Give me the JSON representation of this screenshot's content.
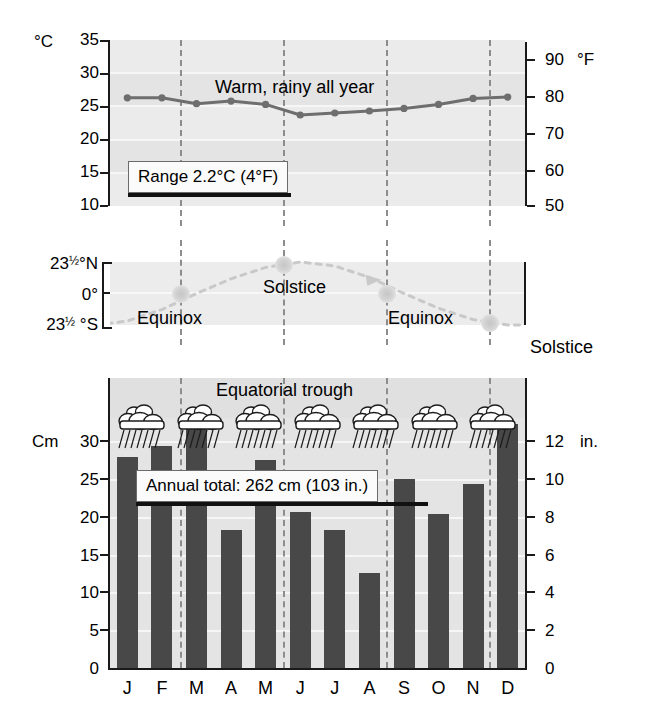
{
  "chart_data": [
    {
      "type": "line",
      "title": "Temperature",
      "categories": [
        "J",
        "F",
        "M",
        "A",
        "M",
        "J",
        "J",
        "A",
        "S",
        "O",
        "N",
        "D"
      ],
      "values": [
        26.3,
        26.3,
        25.4,
        25.8,
        25.3,
        23.7,
        24.0,
        24.3,
        24.7,
        25.3,
        26.2,
        26.4
      ],
      "ylabel": "°C",
      "ylabel_right": "°F",
      "yticks": [
        10,
        15,
        20,
        25,
        30,
        35
      ],
      "yticks_right": [
        50,
        60,
        70,
        80,
        90
      ],
      "ylim": [
        10,
        35
      ],
      "ylim_right": [
        50,
        90
      ],
      "grid": true,
      "annotation": "Warm, rainy all year",
      "callout": "Range 2.2°C (4°F)"
    },
    {
      "type": "line",
      "title": "Sun's declination",
      "categories": [
        "J",
        "F",
        "M",
        "A",
        "M",
        "J",
        "J",
        "A",
        "S",
        "O",
        "N",
        "D"
      ],
      "values": [
        -20.5,
        -12.0,
        0.0,
        11.0,
        19.5,
        23.5,
        20.5,
        12.0,
        0.0,
        -11.0,
        -19.5,
        -23.5
      ],
      "ytick_labels": [
        "23½°N",
        "0°",
        "23½ °S"
      ],
      "ylim": [
        -23.5,
        23.5
      ],
      "markers": [
        {
          "label": "Equinox",
          "month": "M"
        },
        {
          "label": "Solstice",
          "month": "J"
        },
        {
          "label": "Equinox",
          "month": "S"
        },
        {
          "label": "Solstice",
          "month": "D"
        }
      ]
    },
    {
      "type": "bar",
      "title": "Precipitation",
      "categories": [
        "J",
        "F",
        "M",
        "A",
        "M",
        "J",
        "J",
        "A",
        "S",
        "O",
        "N",
        "D"
      ],
      "values": [
        24.0,
        25.3,
        29.0,
        15.7,
        23.7,
        17.8,
        15.7,
        10.8,
        21.5,
        17.5,
        21.0,
        27.8
      ],
      "ylabel": "Cm",
      "ylabel_right": "in.",
      "yticks": [
        0,
        5,
        10,
        15,
        20,
        25,
        30
      ],
      "yticks_right": [
        0,
        2,
        4,
        6,
        8,
        10,
        12
      ],
      "ylim": [
        0,
        33
      ],
      "ylim_right": [
        0,
        13
      ],
      "grid": true,
      "annotation": "Equatorial trough",
      "callout": "Annual total: 262 cm (103 in.)",
      "weather_icons": 7,
      "weather_icon_name": "rain-cloud-icon"
    }
  ],
  "temp": {
    "unit_left": "°C",
    "unit_right": "°F",
    "ticks_left": [
      "35",
      "30",
      "25",
      "20",
      "15",
      "10"
    ],
    "ticks_right": [
      "90",
      "80",
      "70",
      "60",
      "50"
    ],
    "note": "Warm, rainy all year",
    "callout": "Range 2.2°C (4°F)"
  },
  "declination": {
    "label_north_num": "23",
    "label_north_frac": "1/2",
    "label_north_unit": "°N",
    "label_zero": "0°",
    "label_south_num": "23",
    "label_south_frac": "1/2",
    "label_south_unit": "°S",
    "equinox_left": "Equinox",
    "solstice_mid": "Solstice",
    "equinox_right": "Equinox",
    "solstice_right": "Solstice"
  },
  "precip": {
    "unit_left": "Cm",
    "unit_right": "in.",
    "ticks_left": [
      "30",
      "25",
      "20",
      "15",
      "10",
      "5",
      "0"
    ],
    "ticks_right": [
      "12",
      "10",
      "8",
      "6",
      "4",
      "2",
      "0"
    ],
    "note": "Equatorial trough",
    "callout": "Annual total: 262 cm (103 in.)"
  },
  "months": [
    "J",
    "F",
    "M",
    "A",
    "M",
    "J",
    "J",
    "A",
    "S",
    "O",
    "N",
    "D"
  ]
}
